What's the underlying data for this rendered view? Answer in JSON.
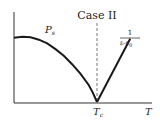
{
  "chart_data": {
    "type": "line",
    "title": "Case II",
    "xlabel": "T",
    "ylabel": "",
    "grid": false,
    "legend": "none",
    "xlim": [
      0,
      1.45
    ],
    "ylim": [
      0,
      1
    ],
    "x_ticks": [
      {
        "value": 1.0,
        "label_main": "T",
        "label_sub": "c"
      }
    ],
    "vertical_marker": {
      "x": 1.0,
      "style": "dashed"
    },
    "series": [
      {
        "name": "P_s",
        "label_main": "P",
        "label_sub": "s",
        "x": [
          0.0,
          0.1,
          0.2,
          0.3,
          0.4,
          0.5,
          0.6,
          0.7,
          0.8,
          0.9,
          0.95,
          1.0
        ],
        "values": [
          0.68,
          0.69,
          0.685,
          0.66,
          0.62,
          0.56,
          0.49,
          0.4,
          0.3,
          0.18,
          0.1,
          0.0
        ]
      },
      {
        "name": "1/(ε-ε0)",
        "label_numerator": "1",
        "label_denominator_main": "ε-ε",
        "label_denominator_sub": "0",
        "x": [
          1.0,
          1.4
        ],
        "values": [
          0.0,
          0.67
        ]
      }
    ],
    "colors": {
      "line": "#1a1a1a",
      "axis": "#333333",
      "dashed": "#777777"
    }
  }
}
